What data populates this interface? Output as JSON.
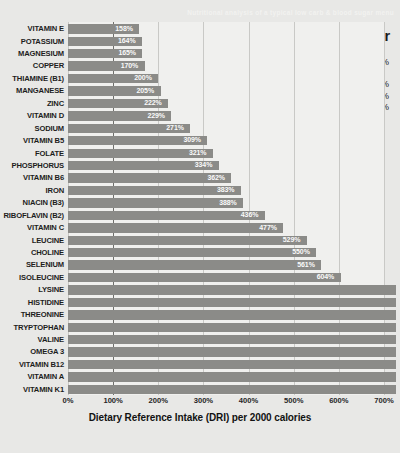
{
  "watermark": "Nutritional analysis of a typical low carb & blood sugar menu",
  "header": {
    "title": "low carb & blood sugar",
    "oni_score_label": "ONI score = 61%",
    "macros": [
      "protein = 24%",
      "fat = 67%",
      "net carbs = 5%"
    ]
  },
  "axis": {
    "title": "Dietary Reference Intake (DRI) per 2000 calories",
    "ticks": [
      "0%",
      "100%",
      "200%",
      "300%",
      "400%",
      "500%",
      "600%",
      "700%"
    ]
  },
  "colors": {
    "background": "#e8e8e6",
    "plot_background": "#f0f0ee",
    "bar": "#8b8b88",
    "gridline": "#c9c9c6",
    "zero_line": "#6f6f6c",
    "text": "#1d1d1d",
    "bar_label": "#fafafa"
  },
  "chart_data": {
    "type": "bar",
    "orientation": "horizontal",
    "title": "low carb & blood sugar",
    "xlabel": "Dietary Reference Intake (DRI) per 2000 calories",
    "ylabel": "",
    "xlim": [
      0,
      700
    ],
    "xtick_values": [
      0,
      100,
      200,
      300,
      400,
      500,
      600,
      700
    ],
    "xtick_labels": [
      "0%",
      "100%",
      "200%",
      "300%",
      "400%",
      "500%",
      "600%",
      "700%"
    ],
    "grid": true,
    "legend": "none",
    "note": "Bars below ISOLEUCINE exceed the 700% axis maximum and are drawn clipped at the plot edge with no printed value label.",
    "categories": [
      "VITAMIN E",
      "POTASSIUM",
      "MAGNESIUM",
      "COPPER",
      "THIAMINE (B1)",
      "MANGANESE",
      "ZINC",
      "VITAMIN D",
      "SODIUM",
      "VITAMIN B5",
      "FOLATE",
      "PHOSPHORUS",
      "VITAMIN B6",
      "IRON",
      "NIACIN (B3)",
      "RIBOFLAVIN (B2)",
      "VITAMIN C",
      "LEUCINE",
      "CHOLINE",
      "SELENIUM",
      "ISOLEUCINE",
      "LYSINE",
      "HISTIDINE",
      "THREONINE",
      "TRYPTOPHAN",
      "VALINE",
      "OMEGA 3",
      "VITAMIN B12",
      "VITAMIN A",
      "VITAMIN K1"
    ],
    "values": [
      158,
      164,
      165,
      170,
      200,
      205,
      222,
      229,
      271,
      309,
      321,
      334,
      362,
      383,
      388,
      436,
      477,
      529,
      550,
      561,
      604,
      700,
      700,
      700,
      700,
      700,
      700,
      700,
      700,
      700
    ],
    "value_labels": [
      "158%",
      "164%",
      "165%",
      "170%",
      "200%",
      "205%",
      "222%",
      "229%",
      "271%",
      "309%",
      "321%",
      "334%",
      "362%",
      "383%",
      "388%",
      "436%",
      "477%",
      "529%",
      "550%",
      "561%",
      "604%",
      "",
      "",
      "",
      "",
      "",
      "",
      "",
      "",
      ""
    ]
  }
}
